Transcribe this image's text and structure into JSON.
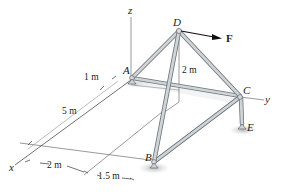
{
  "figure": {
    "type": "space truss statics diagram",
    "colors": {
      "member_fill": "#c9cfd3",
      "member_edge": "#6b7378",
      "line": "#333333",
      "shadow": "#b8bcbf",
      "force": "#111111"
    }
  },
  "axes": {
    "x": "x",
    "y": "y",
    "z": "z"
  },
  "joints": {
    "A": "A",
    "B": "B",
    "C": "C",
    "D": "D",
    "E": "E"
  },
  "force": {
    "label": "F"
  },
  "dimensions": {
    "d1": "1 m",
    "d2": "5 m",
    "height": "2 m",
    "d3": "2 m",
    "d4": "1.5 m"
  }
}
